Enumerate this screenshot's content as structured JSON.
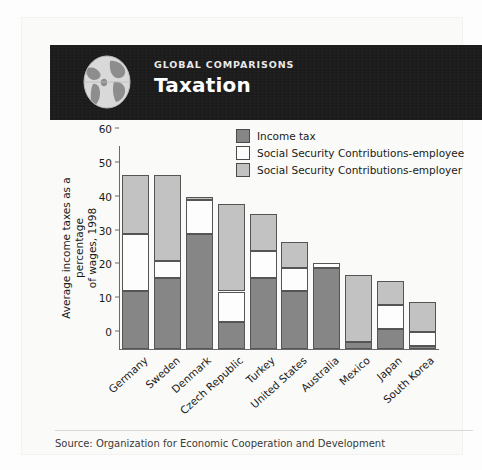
{
  "banner": {
    "kicker": "GLOBAL COMPARISONS",
    "title": "Taxation",
    "icon": "globe-icon",
    "background_color": "#1b1b1b"
  },
  "legend": {
    "items": [
      {
        "label": "Income tax",
        "color": "#868686",
        "key": "income_tax"
      },
      {
        "label": "Social Security Contributions-employee",
        "color": "#ffffff",
        "key": "ss_employee"
      },
      {
        "label": "Social Security Contributions-employer",
        "color": "#c2c2c2",
        "key": "ss_employer"
      }
    ]
  },
  "footer": {
    "source": "Source: Organization for Economic Cooperation and Development"
  },
  "chart_data": {
    "type": "bar",
    "stacked": true,
    "title": "Taxation",
    "xlabel": "",
    "ylabel": "Average income taxes as a percentage of wages, 1998",
    "ylabel_lines": [
      "Average income taxes as a percentage",
      "of wages, 1998"
    ],
    "ylim": [
      0,
      60
    ],
    "yticks": [
      0,
      10,
      20,
      30,
      40,
      50,
      60
    ],
    "ytick_labels": [
      "0",
      "10",
      "20",
      "30",
      "40",
      "50",
      "60"
    ],
    "grid": false,
    "legend_position": "top-right",
    "categories": [
      "Germany",
      "Sweden",
      "Denmark",
      "Czech Republic",
      "Turkey",
      "United States",
      "Australia",
      "Mexico",
      "Japan",
      "South Korea"
    ],
    "series": [
      {
        "name": "Income tax",
        "color": "#868686",
        "values": [
          17,
          21,
          34,
          8,
          21,
          17,
          24,
          2,
          6,
          1
        ]
      },
      {
        "name": "Social Security Contributions-employee",
        "color": "#ffffff",
        "values": [
          17,
          5,
          10,
          9,
          8,
          7,
          1.5,
          0,
          7,
          4
        ]
      },
      {
        "name": "Social Security Contributions-employer",
        "color": "#c2c2c2",
        "values": [
          17.5,
          25.5,
          1,
          26,
          11,
          7.5,
          0,
          20,
          7,
          9
        ]
      }
    ],
    "totals": [
      51.5,
      51.5,
      45,
      43,
      40,
      31.5,
      25.5,
      22,
      20,
      14
    ]
  }
}
